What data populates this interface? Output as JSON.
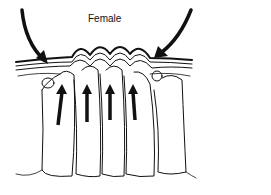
{
  "diagram": {
    "label": "Female",
    "colors": {
      "line": "#111111",
      "background": "#ffffff"
    }
  }
}
